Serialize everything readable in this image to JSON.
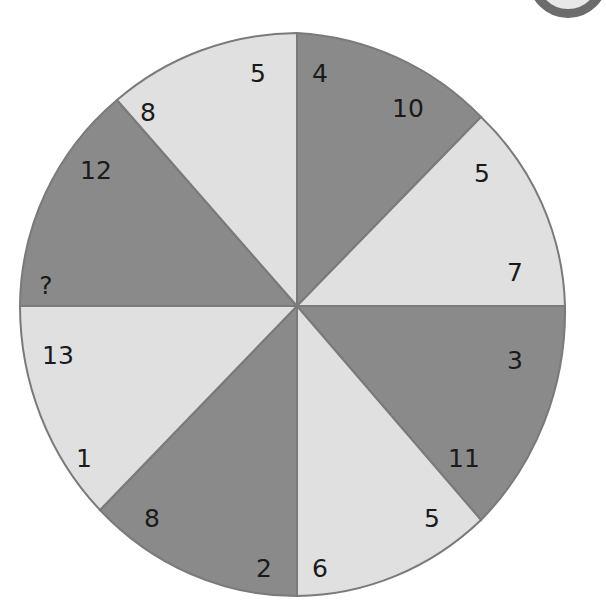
{
  "puzzle": {
    "type": "number-wheel",
    "colors": {
      "dark": "#8a8a8a",
      "light": "#e0e0e0",
      "border": "#7a7a7a",
      "text": "#1a1a1a"
    },
    "sectors": [
      {
        "id": "top-right-dark",
        "shade": "dark",
        "numbers": [
          "4",
          "10"
        ]
      },
      {
        "id": "right-upper-light",
        "shade": "light",
        "numbers": [
          "5",
          "7"
        ]
      },
      {
        "id": "right-lower-dark",
        "shade": "dark",
        "numbers": [
          "3",
          "11"
        ]
      },
      {
        "id": "bottom-right-light",
        "shade": "light",
        "numbers": [
          "5",
          "6"
        ]
      },
      {
        "id": "bottom-left-dark",
        "shade": "dark",
        "numbers": [
          "2",
          "8"
        ]
      },
      {
        "id": "left-lower-light",
        "shade": "light",
        "numbers": [
          "1",
          "13"
        ]
      },
      {
        "id": "left-upper-dark",
        "shade": "dark",
        "numbers": [
          "?",
          "12"
        ]
      },
      {
        "id": "top-left-light",
        "shade": "light",
        "numbers": [
          "8",
          "5"
        ]
      }
    ],
    "unknown_marker": "?"
  }
}
